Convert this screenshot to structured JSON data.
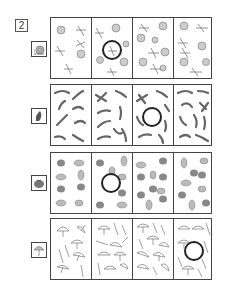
{
  "worksheet": {
    "exercise_number": "2",
    "rows": [
      {
        "name": "snails-dragonflies",
        "reference_icon": "snail-icon",
        "items": [
          "snail-icon",
          "dragonfly-icon"
        ],
        "circled_panel": 2
      },
      {
        "name": "pea-pods",
        "reference_icon": "pea-pod-icon",
        "items": [
          "pea-pod-icon",
          "bean-icon"
        ],
        "circled_panel": 3
      },
      {
        "name": "tomatoes-grapes",
        "reference_icon": "tomato-icon",
        "items": [
          "tomato-icon",
          "grapes-icon"
        ],
        "circled_panel": 2
      },
      {
        "name": "umbrellas",
        "reference_icon": "umbrella-icon",
        "items": [
          "umbrella-icon",
          "closed-umbrella-icon"
        ],
        "circled_panel": 4
      }
    ]
  }
}
